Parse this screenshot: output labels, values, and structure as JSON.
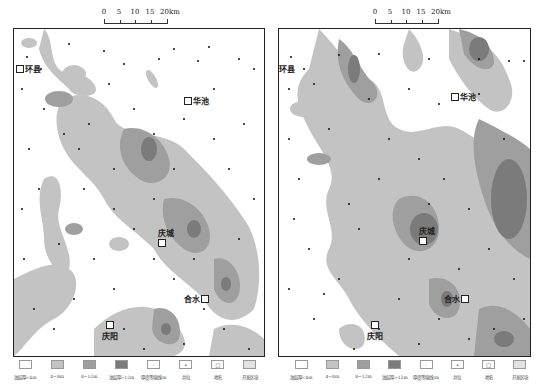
{
  "colors": {
    "thin_lt4": "#ffffff",
    "c4_8": "#c3c3c3",
    "c8_12": "#9f9f9f",
    "gt12": "#7b7b7b",
    "border": "#222222",
    "well": "#111111"
  },
  "scalebar": {
    "ticks": [
      "0",
      "5",
      "10",
      "15",
      "20km"
    ]
  },
  "maps": [
    {
      "id": "left",
      "towns": [
        {
          "name": "环县",
          "x": 2,
          "y": 34
        },
        {
          "name": "华池",
          "x": 170,
          "y": 66
        },
        {
          "name": "庆城",
          "x": 148,
          "y": 205
        },
        {
          "name": "合水",
          "x": 172,
          "y": 268
        },
        {
          "name": "庆阳",
          "x": 88,
          "y": 296
        }
      ]
    },
    {
      "id": "right",
      "towns": [
        {
          "name": "环县",
          "x": -11,
          "y": 34
        },
        {
          "name": "华池",
          "x": 172,
          "y": 62
        },
        {
          "name": "庆城",
          "x": 142,
          "y": 205
        },
        {
          "name": "合水",
          "x": 170,
          "y": 268
        },
        {
          "name": "庆阳",
          "x": 88,
          "y": 296
        }
      ]
    }
  ],
  "legend": [
    {
      "label": "油层厚<4m",
      "swatch": "thin_lt4",
      "symbol": ""
    },
    {
      "label": "4~8m",
      "swatch": "c4_8",
      "symbol": ""
    },
    {
      "label": "8~12m",
      "swatch": "c8_12",
      "symbol": ""
    },
    {
      "label": "油层厚>12m",
      "swatch": "gt12",
      "symbol": ""
    },
    {
      "label": "厚度等值线/m",
      "swatch": "thin_lt4",
      "symbol": "·"
    },
    {
      "label": "井位",
      "swatch": "thin_lt4",
      "symbol": "•"
    },
    {
      "label": "地名",
      "swatch": "thin_lt4",
      "symbol": "□"
    },
    {
      "label": "开发区块",
      "swatch": "c4_8",
      "symbol": ""
    }
  ]
}
